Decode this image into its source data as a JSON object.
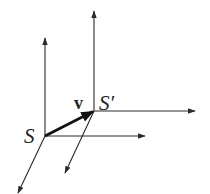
{
  "diagram": {
    "title": "",
    "stroke_color": "#2a2a2a",
    "background": "#ffffff",
    "frames": [
      {
        "id": "S",
        "label": "S",
        "origin": [
          45,
          136
        ],
        "axes": {
          "vertical_tip": [
            45,
            38
          ],
          "horizontal_tip": [
            145,
            136
          ],
          "depth_tip": [
            18,
            193
          ]
        }
      },
      {
        "id": "S-prime",
        "label": "S′",
        "origin": [
          94,
          111
        ],
        "axes": {
          "vertical_tip": [
            94,
            11
          ],
          "horizontal_tip": [
            195,
            111
          ],
          "depth_tip": [
            65,
            173
          ]
        }
      }
    ],
    "velocity": {
      "label": "v",
      "from": [
        45,
        136
      ],
      "to": [
        94,
        111
      ]
    }
  }
}
